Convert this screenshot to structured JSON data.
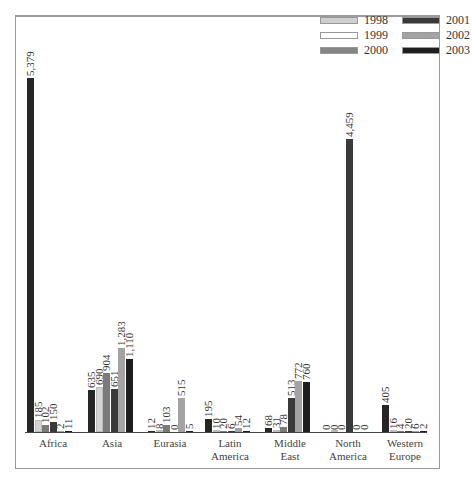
{
  "chart_data": {
    "type": "bar",
    "title": "",
    "xlabel": "",
    "ylabel": "",
    "categories": [
      "Africa",
      "Asia",
      "Eurasia",
      "Latin America",
      "Middle East",
      "North America",
      "Western Europe"
    ],
    "category_lines": [
      [
        "Africa"
      ],
      [
        "Asia"
      ],
      [
        "Eurasia"
      ],
      [
        "Latin",
        "America"
      ],
      [
        "Middle",
        "East"
      ],
      [
        "North",
        "America"
      ],
      [
        "Western",
        "Europe"
      ]
    ],
    "legend": [
      "1998",
      "1999",
      "2000",
      "2001",
      "2002",
      "2003"
    ],
    "legend_colors": [
      "#cfcfcf",
      "#ffffff",
      "#858585",
      "#3a3a3a",
      "#a3a3a3",
      "#1e1e1e"
    ],
    "bar_colors_visual_order": [
      "#262626",
      "#d4d4d4",
      "#7a7a7a",
      "#3a3a3a",
      "#a3a3a3",
      "#1e1e1e"
    ],
    "groups": [
      {
        "category": "Africa",
        "values": [
          5379,
          185,
          102,
          150,
          2,
          11
        ],
        "labels": [
          "5,379",
          "185",
          "102",
          "150",
          "2",
          "11"
        ]
      },
      {
        "category": "Asia",
        "values": [
          635,
          690,
          904,
          651,
          1283,
          1110
        ],
        "labels": [
          "635",
          "690",
          "904",
          "651",
          "1,283",
          "1,110"
        ]
      },
      {
        "category": "Eurasia",
        "values": [
          12,
          8,
          103,
          0,
          515,
          5
        ],
        "labels": [
          "12",
          "8",
          "103",
          "0",
          "515",
          "5"
        ]
      },
      {
        "category": "Latin America",
        "values": [
          195,
          10,
          20,
          6,
          54,
          12
        ],
        "labels": [
          "195",
          "10",
          "20",
          "6",
          "54",
          "12"
        ]
      },
      {
        "category": "Middle East",
        "values": [
          68,
          31,
          78,
          513,
          772,
          760
        ],
        "labels": [
          "68",
          "31",
          "78",
          "513",
          "772",
          "760"
        ]
      },
      {
        "category": "North America",
        "values": [
          0,
          0,
          0,
          4459,
          0,
          0
        ],
        "labels": [
          "0",
          "0",
          "0",
          "4,459",
          "0",
          "0"
        ]
      },
      {
        "category": "Western Europe",
        "values": [
          405,
          16,
          4,
          20,
          6,
          2
        ],
        "labels": [
          "405",
          "16",
          "4",
          "20",
          "6",
          "2"
        ]
      }
    ],
    "ylim": [
      0,
      5379
    ],
    "grid": false,
    "legend_position": "top-right"
  }
}
